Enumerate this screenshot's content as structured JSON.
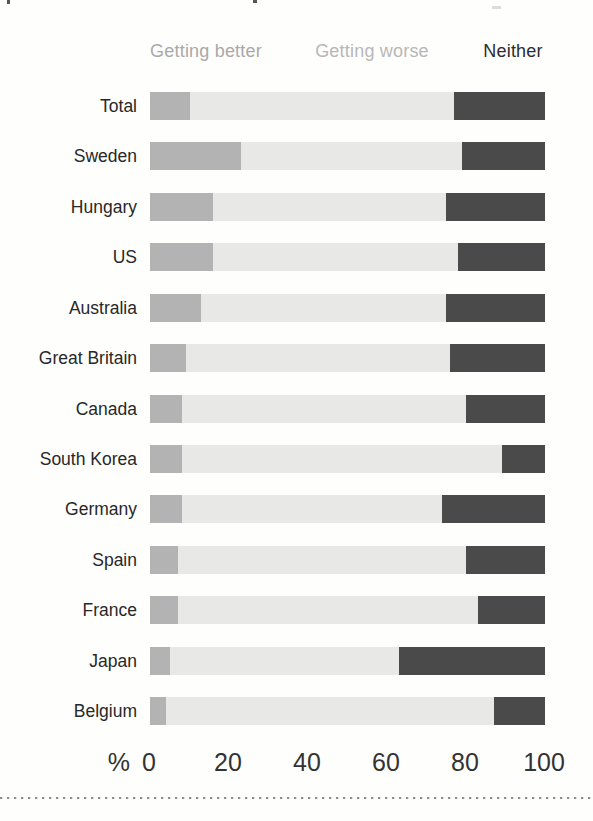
{
  "legend": {
    "better": "Getting better",
    "worse": "Getting worse",
    "neither": "Neither"
  },
  "axis": {
    "unit": "%",
    "ticks": [
      0,
      20,
      40,
      60,
      80,
      100
    ]
  },
  "colors": {
    "better_fill": "#b3b3b3",
    "worse_fill": "#e8e8e6",
    "neither_fill": "#4a4a4a",
    "legend_better_text": "#a9a9a9",
    "legend_worse_text": "#b7b7b7",
    "legend_neither_text": "#2d2d2d",
    "row_label_text": "#282828",
    "axis_text": "#333333"
  },
  "chart_data": {
    "type": "bar",
    "orientation": "horizontal",
    "stacked": true,
    "title": "",
    "xlabel": "%",
    "xlim": [
      0,
      100
    ],
    "x_ticks": [
      0,
      20,
      40,
      60,
      80,
      100
    ],
    "grid": false,
    "legend_position": "top",
    "categories": [
      "Total",
      "Sweden",
      "Hungary",
      "US",
      "Australia",
      "Great Britain",
      "Canada",
      "South Korea",
      "Germany",
      "Spain",
      "France",
      "Japan",
      "Belgium"
    ],
    "series": [
      {
        "name": "Getting better",
        "values": [
          10,
          23,
          16,
          16,
          13,
          9,
          8,
          8,
          8,
          7,
          7,
          5,
          4
        ]
      },
      {
        "name": "Getting worse",
        "values": [
          67,
          56,
          59,
          62,
          62,
          67,
          72,
          81,
          66,
          73,
          76,
          58,
          83
        ]
      },
      {
        "name": "Neither",
        "values": [
          23,
          21,
          25,
          22,
          25,
          24,
          20,
          11,
          26,
          20,
          17,
          37,
          13
        ]
      }
    ]
  }
}
